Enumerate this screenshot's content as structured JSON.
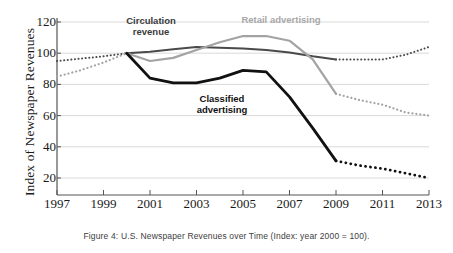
{
  "figure": {
    "caption": "Figure 4: U.S. Newspaper Revenues over Time (Index: year 2000 = 100).",
    "ylabel": "Index of Newspaper Revenues"
  },
  "axis": {
    "y_ticks": [
      "120",
      "100",
      "80",
      "60",
      "40",
      "20"
    ],
    "x_ticks": [
      "1997",
      "1999",
      "2001",
      "2003",
      "2005",
      "2007",
      "2009",
      "2011",
      "2013"
    ]
  },
  "labels": {
    "circulation": "Circulation\nrevenue",
    "retail": "Retail advertising",
    "classified": "Classified\nadvertising"
  },
  "colors": {
    "circulation": "#4a4a4a",
    "retail": "#a3a3a3",
    "classified": "#111111",
    "grid": "#cfcfcf",
    "axis": "#555555",
    "background": "#ffffff"
  },
  "chart_data": {
    "type": "line",
    "title": "U.S. Newspaper Revenues over Time (Index: year 2000 = 100)",
    "xlabel": "",
    "ylabel": "Index of Newspaper Revenues",
    "xlim": [
      1997,
      2013
    ],
    "ylim": [
      20,
      120
    ],
    "ytick_values": [
      120,
      100,
      80,
      60,
      40,
      20
    ],
    "xtick_values": [
      1997,
      1999,
      2001,
      2003,
      2005,
      2007,
      2009,
      2011,
      2013
    ],
    "grid": true,
    "legend": "inline-annotations",
    "note": "Solid segments span 2000-2009 (observed); dotted segments before 2000 and after 2009.",
    "x": [
      1997,
      1998,
      1999,
      2000,
      2001,
      2002,
      2003,
      2004,
      2005,
      2006,
      2007,
      2008,
      2009,
      2010,
      2011,
      2012,
      2013
    ],
    "series": [
      {
        "name": "Circulation revenue",
        "color": "#4a4a4a",
        "style_solid_range": [
          2000,
          2009
        ],
        "values": [
          95,
          96.5,
          98,
          100,
          101,
          102.5,
          104,
          103.5,
          103,
          102,
          100.5,
          98,
          96,
          96,
          96,
          99,
          104
        ]
      },
      {
        "name": "Retail advertising",
        "color": "#a3a3a3",
        "style_solid_range": [
          2000,
          2009
        ],
        "values": [
          85,
          89,
          94,
          100,
          95,
          97,
          102,
          107,
          111,
          111,
          108,
          96,
          74,
          70,
          67,
          62,
          60
        ]
      },
      {
        "name": "Classified advertising",
        "color": "#111111",
        "style_solid_range": [
          2000,
          2009
        ],
        "values": [
          null,
          null,
          null,
          100,
          84,
          81,
          81,
          84,
          89,
          88,
          72,
          52,
          31,
          28,
          26,
          23,
          20
        ]
      }
    ]
  }
}
